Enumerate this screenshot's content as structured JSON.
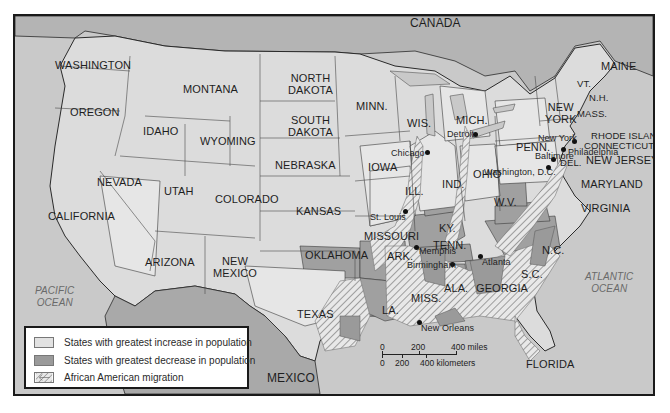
{
  "map": {
    "title": "",
    "colors": {
      "water": "#c9c9c9",
      "land_neutral": "#dcdcdc",
      "increase": "#e2e2e2",
      "decrease": "#9a9a9a",
      "foreign": "#b0b0b0",
      "border": "#2a2a2a"
    },
    "countries": [
      {
        "id": "canada",
        "label": "CANADA"
      },
      {
        "id": "mexico",
        "label": "MEXICO"
      }
    ],
    "oceans": [
      {
        "id": "pacific",
        "line1": "PACIFIC",
        "line2": "OCEAN"
      },
      {
        "id": "atlantic",
        "line1": "ATLANTIC",
        "line2": "OCEAN"
      }
    ],
    "states": {
      "washington": "WASHINGTON",
      "oregon": "OREGON",
      "california": "CALIFORNIA",
      "idaho": "IDAHO",
      "nevada": "NEVADA",
      "montana": "MONTANA",
      "wyoming": "WYOMING",
      "utah": "UTAH",
      "arizona": "ARIZONA",
      "colorado": "COLORADO",
      "new_mexico_1": "NEW",
      "new_mexico_2": "MEXICO",
      "north_dakota_1": "NORTH",
      "north_dakota_2": "DAKOTA",
      "south_dakota_1": "SOUTH",
      "south_dakota_2": "DAKOTA",
      "nebraska": "NEBRASKA",
      "kansas": "KANSAS",
      "oklahoma": "OKLAHOMA",
      "texas": "TEXAS",
      "minnesota": "MINN.",
      "iowa": "IOWA",
      "missouri": "MISSOURI",
      "arkansas": "ARK.",
      "louisiana": "LA.",
      "wisconsin": "WIS.",
      "illinois": "ILL.",
      "michigan": "MICH.",
      "indiana": "IND.",
      "ohio": "OHIO",
      "kentucky": "KY.",
      "tennessee": "TENN.",
      "mississippi": "MISS.",
      "alabama": "ALA.",
      "georgia": "GEORGIA",
      "florida": "FLORIDA",
      "south_carolina": "S.C.",
      "north_carolina": "N.C.",
      "virginia": "VIRGINIA",
      "west_virginia": "W.V.",
      "maryland": "MARYLAND",
      "delaware": "DEL.",
      "new_jersey": "NEW JERSEY",
      "pennsylvania": "PENN.",
      "new_york_1": "NEW",
      "new_york_2": "YORK",
      "connecticut": "CONNECTICUT",
      "rhode_island": "RHODE ISLAND",
      "massachusetts": "MASS.",
      "vermont": "VT.",
      "new_hampshire": "N.H.",
      "maine": "MAINE"
    },
    "cities": [
      {
        "id": "detroit",
        "label": "Detroit"
      },
      {
        "id": "chicago",
        "label": "Chicago"
      },
      {
        "id": "st_louis",
        "label": "St. Louis"
      },
      {
        "id": "memphis",
        "label": "Memphis"
      },
      {
        "id": "birmingham",
        "label": "Birmingham"
      },
      {
        "id": "atlanta",
        "label": "Atlanta"
      },
      {
        "id": "new_orleans",
        "label": "New Orleans"
      },
      {
        "id": "new_york",
        "label": "New York"
      },
      {
        "id": "philadelphia",
        "label": "Philadelphia"
      },
      {
        "id": "baltimore",
        "label": "Baltimore"
      },
      {
        "id": "washington_dc",
        "label": "Washington, D.C."
      }
    ],
    "legend": {
      "items": [
        {
          "label": "States with greatest increase in population",
          "swatch": "increase"
        },
        {
          "label": "States with greatest decrease in population",
          "swatch": "decrease"
        },
        {
          "label": "African American migration",
          "swatch": "migration-arrow"
        }
      ]
    },
    "scale": {
      "miles": [
        "0",
        "200",
        "400 miles"
      ],
      "kilometers": [
        "0",
        "200",
        "400 kilometers"
      ]
    }
  }
}
